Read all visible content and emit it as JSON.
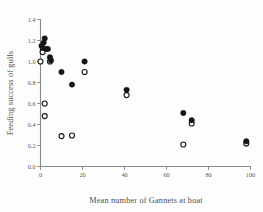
{
  "chart_data": {
    "type": "scatter",
    "title": "",
    "xlabel": "Mean number of Gannets at boat",
    "ylabel": "Feeding success of gulls",
    "xlim": [
      0,
      100
    ],
    "ylim": [
      0.0,
      1.4
    ],
    "xticks": [
      0,
      20,
      40,
      60,
      80,
      100
    ],
    "xtick_labels": [
      "0",
      "20",
      "40",
      "60",
      "80",
      "100"
    ],
    "yticks": [
      0.0,
      0.2,
      0.4,
      0.6,
      0.8,
      1.0,
      1.2,
      1.4
    ],
    "ytick_labels": [
      "0.0",
      "0.2",
      "0.4",
      "0.6",
      "0.8",
      "1.0",
      "1.2",
      "1.4"
    ],
    "grid": false,
    "legend": "none",
    "series": [
      {
        "name": "filled-circles",
        "marker": "filled-circle",
        "color": "#141414",
        "points": [
          [
            0.5,
            1.15
          ],
          [
            1.0,
            1.13
          ],
          [
            1.5,
            1.18
          ],
          [
            2.0,
            1.22
          ],
          [
            2.5,
            1.12
          ],
          [
            3.5,
            1.12
          ],
          [
            4.5,
            1.04
          ],
          [
            5.0,
            1.01
          ],
          [
            10.0,
            0.9
          ],
          [
            15.0,
            0.78
          ],
          [
            21.0,
            1.0
          ],
          [
            41.0,
            0.73
          ],
          [
            68.0,
            0.51
          ],
          [
            72.0,
            0.44
          ],
          [
            98.0,
            0.24
          ]
        ]
      },
      {
        "name": "open-circles",
        "marker": "open-circle",
        "color": "#ffffff",
        "points": [
          [
            0.0,
            1.0
          ],
          [
            1.0,
            1.09
          ],
          [
            2.0,
            0.6
          ],
          [
            2.0,
            0.48
          ],
          [
            4.5,
            1.0
          ],
          [
            10.0,
            0.29
          ],
          [
            15.0,
            0.295
          ],
          [
            21.0,
            0.9
          ],
          [
            41.0,
            0.68
          ],
          [
            68.0,
            0.21
          ],
          [
            72.0,
            0.41
          ],
          [
            98.0,
            0.22
          ]
        ]
      }
    ]
  },
  "axes": {
    "x_title": "Mean number of Gannets at boat",
    "y_title": "Feeding success of gulls"
  },
  "colors": {
    "axis": "#8a8a8a",
    "tick_text": "#5b5b5b",
    "title_text": "#4f4f4f",
    "filled_marker": "#141414",
    "open_marker_stroke": "#1a1a1a",
    "background": "#fdfdfd"
  }
}
